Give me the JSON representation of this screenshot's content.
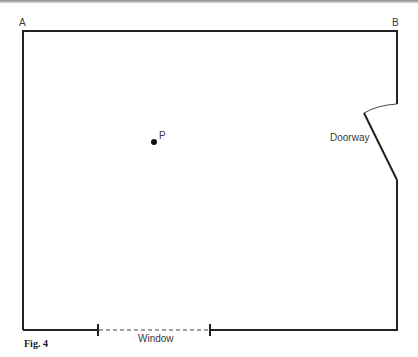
{
  "figure": {
    "caption": "Fig. 4",
    "corner_labels": {
      "a": "A",
      "b": "B"
    },
    "point_label": "P",
    "doorway_label": "Doorway",
    "window_label": "Window",
    "colors": {
      "wall": "#222222",
      "text": "#3a3a3a",
      "background": "#ffffff"
    }
  }
}
